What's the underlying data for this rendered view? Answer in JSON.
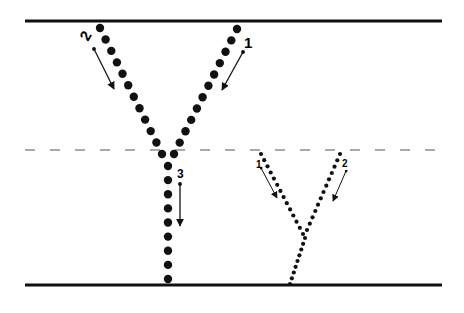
{
  "diagram": {
    "width": 464,
    "height": 313,
    "colors": {
      "ink": "#111111",
      "dash": "#555555",
      "background": "#ffffff"
    },
    "boundaries": {
      "top_line": {
        "x1": 25,
        "x2": 442,
        "y": 21,
        "width": 3
      },
      "middle_dashed_line": {
        "x1": 25,
        "x2": 442,
        "y": 150,
        "width": 1.2,
        "dash": "10,15"
      },
      "bottom_line": {
        "x1": 25,
        "x2": 442,
        "y": 285,
        "width": 3
      }
    },
    "large_junction": {
      "dot_radius": 4.2,
      "branches": [
        {
          "name": "branch-2",
          "from": [
            100,
            28
          ],
          "to": [
            162,
            154
          ],
          "count": 12
        },
        {
          "name": "branch-1",
          "from": [
            237,
            29
          ],
          "to": [
            174,
            154
          ],
          "count": 12
        },
        {
          "name": "stem-3",
          "from": [
            168,
            166
          ],
          "to": [
            168,
            279
          ],
          "count": 9
        }
      ],
      "labels": [
        {
          "text": "2",
          "x": 88,
          "y": 42,
          "size": 15,
          "rotate": -60
        },
        {
          "text": "1",
          "x": 244,
          "y": 48,
          "size": 15,
          "rotate": 0
        },
        {
          "text": "3",
          "x": 177,
          "y": 178,
          "size": 12,
          "rotate": 0
        }
      ],
      "arrows": [
        {
          "name": "arrow-2",
          "from": [
            94,
            49
          ],
          "to": [
            114,
            89
          ]
        },
        {
          "name": "arrow-1",
          "from": [
            243,
            52
          ],
          "to": [
            222,
            90
          ]
        },
        {
          "name": "arrow-3",
          "from": [
            180,
            184
          ],
          "to": [
            180,
            226
          ]
        }
      ]
    },
    "small_junction": {
      "dot_radius": 2.1,
      "branches": [
        {
          "name": "branch-1",
          "from": [
            261,
            154
          ],
          "to": [
            303,
            234
          ],
          "count": 14
        },
        {
          "name": "branch-2",
          "from": [
            340,
            154
          ],
          "to": [
            307,
            230
          ],
          "count": 13
        },
        {
          "name": "stem",
          "from": [
            305,
            238
          ],
          "to": [
            290,
            284
          ],
          "count": 9
        }
      ],
      "labels": [
        {
          "text": "1",
          "x": 256,
          "y": 168,
          "size": 10,
          "rotate": 0
        },
        {
          "text": "2",
          "x": 342,
          "y": 167,
          "size": 10,
          "rotate": 0
        }
      ],
      "arrows": [
        {
          "name": "arrow-1",
          "from": [
            261,
            168
          ],
          "to": [
            277,
            198
          ]
        },
        {
          "name": "arrow-2",
          "from": [
            346,
            171
          ],
          "to": [
            333,
            201
          ]
        }
      ]
    }
  }
}
